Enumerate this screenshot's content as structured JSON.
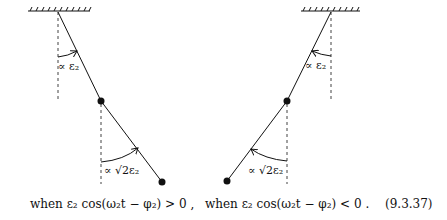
{
  "left_diagram": {
    "upper_angle_label": "∝ ε₂",
    "lower_angle_label": "∝ √2ε₂",
    "caption": "when ε₂ cos(ω₂t − φ₂) > 0 ,"
  },
  "right_diagram": {
    "upper_angle_label": "∝ ε₂",
    "lower_angle_label": "∝ √2ε₂",
    "caption": "when ε₂ cos(ω₂t − φ₂) < 0 ."
  },
  "equation_number": "(9.3.37)",
  "colors": {
    "ink": "#111111",
    "background": "#ffffff"
  }
}
